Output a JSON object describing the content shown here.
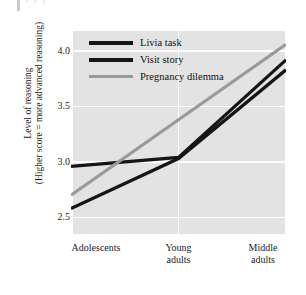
{
  "page_artifact": {
    "ghost_text": "r y  y"
  },
  "chart_data": {
    "type": "line",
    "title": "",
    "xlabel": "",
    "ylabel_line1": "Level of reasoning",
    "ylabel_line2": "(Higher score = more advanced reasoning)",
    "categories": [
      "Adolescents",
      "Young adults",
      "Middle adults"
    ],
    "category_lines": [
      [
        "Adolescents"
      ],
      [
        "Young",
        "adults"
      ],
      [
        "Middle",
        "adults"
      ]
    ],
    "yticks": [
      "4.0",
      "3.5",
      "3.0",
      "2.5"
    ],
    "ytick_values": [
      4.0,
      3.5,
      3.0,
      2.5
    ],
    "ylim": [
      2.35,
      4.18
    ],
    "grid": true,
    "grid_color": "#ffffff",
    "plot_background": "#e3e3e3",
    "legend_position": "top-left",
    "series": [
      {
        "name": "Livia task",
        "values": [
          2.96,
          3.04,
          3.92
        ],
        "color": "#151515",
        "width": 3.2
      },
      {
        "name": "Visit story",
        "values": [
          2.58,
          3.03,
          3.83
        ],
        "color": "#151515",
        "width": 3.2
      },
      {
        "name": "Pregnancy dilemma",
        "values": [
          2.7,
          3.38,
          4.06
        ],
        "color": "#9a9a9a",
        "width": 3.2
      }
    ]
  }
}
